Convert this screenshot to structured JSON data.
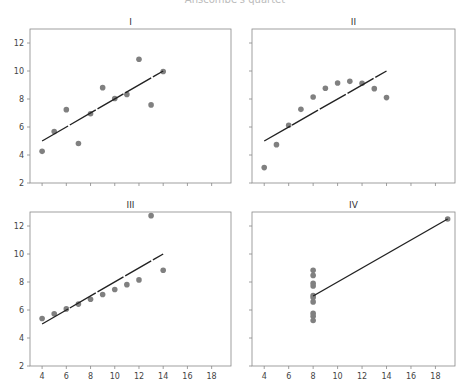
{
  "figure": {
    "suptitle": "Anscombe's quartet"
  },
  "chart_data": [
    {
      "type": "scatter",
      "title": "I",
      "xlim": [
        3,
        19.6
      ],
      "ylim": [
        2,
        13
      ],
      "xticks": [
        4,
        6,
        8,
        10,
        12,
        14,
        16,
        18
      ],
      "yticks": [
        2,
        4,
        6,
        8,
        10,
        12
      ],
      "show_xticklabels": false,
      "show_yticklabels": true,
      "x": [
        10,
        8,
        13,
        9,
        11,
        14,
        6,
        4,
        12,
        7,
        5
      ],
      "y": [
        8.04,
        6.95,
        7.58,
        8.81,
        8.33,
        9.96,
        7.24,
        4.26,
        10.84,
        4.82,
        5.68
      ],
      "fit": {
        "slope": 0.5,
        "intercept": 3.0,
        "x_range": [
          4,
          14
        ]
      }
    },
    {
      "type": "scatter",
      "title": "II",
      "xlim": [
        3,
        19.6
      ],
      "ylim": [
        2,
        13
      ],
      "xticks": [
        4,
        6,
        8,
        10,
        12,
        14,
        16,
        18
      ],
      "yticks": [
        2,
        4,
        6,
        8,
        10,
        12
      ],
      "show_xticklabels": false,
      "show_yticklabels": false,
      "x": [
        10,
        8,
        13,
        9,
        11,
        14,
        6,
        4,
        12,
        7,
        5
      ],
      "y": [
        9.14,
        8.14,
        8.74,
        8.77,
        9.26,
        8.1,
        6.13,
        3.1,
        9.13,
        7.26,
        4.74
      ],
      "fit": {
        "slope": 0.5,
        "intercept": 3.0,
        "x_range": [
          4,
          14
        ]
      }
    },
    {
      "type": "scatter",
      "title": "III",
      "xlim": [
        3,
        19.6
      ],
      "ylim": [
        2,
        13
      ],
      "xticks": [
        4,
        6,
        8,
        10,
        12,
        14,
        16,
        18
      ],
      "yticks": [
        2,
        4,
        6,
        8,
        10,
        12
      ],
      "show_xticklabels": true,
      "show_yticklabels": true,
      "x": [
        10,
        8,
        13,
        9,
        11,
        14,
        6,
        4,
        12,
        7,
        5
      ],
      "y": [
        7.46,
        6.77,
        12.74,
        7.11,
        7.81,
        8.84,
        6.08,
        5.39,
        8.15,
        6.42,
        5.73
      ],
      "fit": {
        "slope": 0.5,
        "intercept": 3.0,
        "x_range": [
          4,
          14
        ]
      }
    },
    {
      "type": "scatter",
      "title": "IV",
      "xlim": [
        3,
        19.6
      ],
      "ylim": [
        2,
        13
      ],
      "xticks": [
        4,
        6,
        8,
        10,
        12,
        14,
        16,
        18
      ],
      "yticks": [
        2,
        4,
        6,
        8,
        10,
        12
      ],
      "show_xticklabels": true,
      "show_yticklabels": false,
      "x": [
        8,
        8,
        8,
        8,
        8,
        8,
        8,
        19,
        8,
        8,
        8
      ],
      "y": [
        6.58,
        5.76,
        7.71,
        8.84,
        8.47,
        7.04,
        5.25,
        12.5,
        5.56,
        7.91,
        6.89
      ],
      "fit": {
        "slope": 0.5,
        "intercept": 3.0,
        "x_range": [
          8,
          19
        ]
      }
    }
  ],
  "style": {
    "point_color": "#808080",
    "line_color": "#222222",
    "frame_color": "#888888",
    "tick_label_color": "#444444"
  }
}
